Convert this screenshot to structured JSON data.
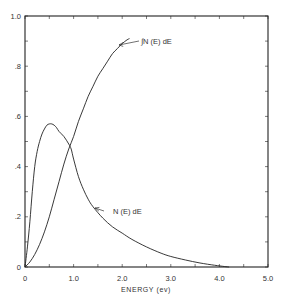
{
  "chart_data": {
    "type": "line",
    "title": "",
    "xlabel": "ENERGY (ev)",
    "ylabel": "",
    "xlim": [
      0,
      5.0
    ],
    "ylim": [
      0,
      1.0
    ],
    "grid": false,
    "legend": "none (curves labeled inline with arrows)",
    "x_tick_labels": [
      "0",
      "1.0",
      "2.0",
      "3.0",
      "4.0",
      "5.0"
    ],
    "y_tick_labels": [
      "0",
      ".2",
      ".4",
      ".6",
      ".8",
      "1.0"
    ],
    "x_minor_tick_step": 0.5,
    "y_minor_tick_step": 0.1,
    "series": [
      {
        "name": "N (E) dE",
        "x": [
          0,
          0.05,
          0.1,
          0.15,
          0.2,
          0.25,
          0.3,
          0.35,
          0.4,
          0.45,
          0.5,
          0.55,
          0.6,
          0.65,
          0.7,
          0.8,
          0.9,
          0.95,
          1.0,
          1.1,
          1.2,
          1.3,
          1.4,
          1.6,
          1.8,
          2.0,
          2.2,
          2.5,
          2.8,
          3.0,
          3.3,
          3.6,
          3.9,
          4.1,
          4.2
        ],
        "y": [
          0,
          0.08,
          0.18,
          0.3,
          0.4,
          0.46,
          0.5,
          0.53,
          0.55,
          0.565,
          0.57,
          0.57,
          0.565,
          0.555,
          0.54,
          0.52,
          0.49,
          0.47,
          0.43,
          0.36,
          0.31,
          0.27,
          0.24,
          0.195,
          0.16,
          0.135,
          0.11,
          0.08,
          0.055,
          0.042,
          0.028,
          0.016,
          0.007,
          0.002,
          0
        ]
      },
      {
        "name": "∫ N (E) dE",
        "x": [
          0,
          0.1,
          0.2,
          0.3,
          0.4,
          0.5,
          0.6,
          0.7,
          0.8,
          0.9,
          1.0,
          1.1,
          1.2,
          1.3,
          1.4,
          1.5,
          1.6,
          1.7,
          1.8,
          1.9,
          2.0,
          2.1,
          2.15
        ],
        "y": [
          0,
          0.02,
          0.05,
          0.09,
          0.14,
          0.2,
          0.27,
          0.34,
          0.41,
          0.47,
          0.52,
          0.58,
          0.63,
          0.68,
          0.72,
          0.76,
          0.79,
          0.82,
          0.85,
          0.87,
          0.89,
          0.905,
          0.91
        ]
      }
    ],
    "annotations": [
      {
        "text": "∫N (E) dE",
        "points_to": {
          "x": 1.87,
          "y": 0.85
        }
      },
      {
        "text": "N (E) dE",
        "points_to": {
          "x": 1.18,
          "y": 0.32
        }
      }
    ]
  },
  "labels": {
    "xlabel": "ENERGY (ev)",
    "integral_annotation": "∫N (E) dE",
    "density_annotation": "N (E) dE"
  }
}
